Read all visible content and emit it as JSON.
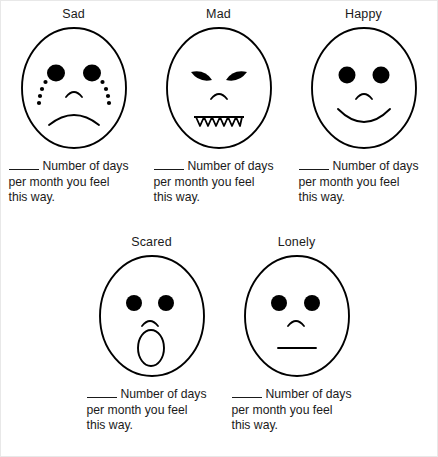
{
  "page": {
    "background_color": "#ffffff",
    "ink_color": "#000000"
  },
  "caption_template": {
    "blank_prefix": "____",
    "line1": "Number of days",
    "line2": "per month you feel",
    "line3": "this way."
  },
  "rows": [
    {
      "cells": [
        {
          "label": "Sad",
          "face": "sad-face",
          "features": {
            "eyes": "round-filled",
            "tears": "dotted-tear-trails",
            "nose": "small-arc",
            "mouth": "frown"
          },
          "caption": {
            "blank_prefix": "____",
            "line1": "Number of days",
            "line2": "per month you feel",
            "line3": "this way."
          }
        },
        {
          "label": "Mad",
          "face": "mad-face",
          "features": {
            "eyes": "angled-almond-filled",
            "nose": "small-arc",
            "mouth": "jagged-teeth"
          },
          "caption": {
            "blank_prefix": "____",
            "line1": "Number of days",
            "line2": "per month you feel",
            "line3": "this way."
          }
        },
        {
          "label": "Happy",
          "face": "happy-face",
          "features": {
            "eyes": "round-filled",
            "nose": "small-arc",
            "mouth": "smile"
          },
          "caption": {
            "blank_prefix": "____",
            "line1": "Number of days",
            "line2": "per month you feel",
            "line3": "this way."
          }
        }
      ]
    },
    {
      "cells": [
        {
          "label": "Scared",
          "face": "scared-face",
          "features": {
            "eyes": "round-filled",
            "nose": "small-arc",
            "mouth": "open-oval"
          },
          "caption": {
            "blank_prefix": "____",
            "line1": "Number of days",
            "line2": "per month you feel",
            "line3": "this way."
          }
        },
        {
          "label": "Lonely",
          "face": "lonely-face",
          "features": {
            "eyes": "round-filled",
            "nose": "small-arc",
            "mouth": "flat-line"
          },
          "caption": {
            "blank_prefix": "____",
            "line1": "Number of days",
            "line2": "per month you feel",
            "line3": "this way."
          }
        }
      ]
    }
  ]
}
